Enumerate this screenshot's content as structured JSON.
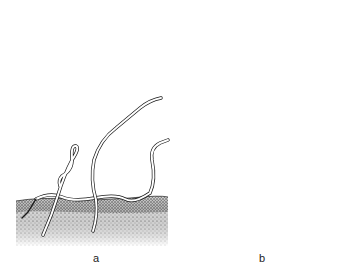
{
  "figure": {
    "colors": {
      "ink": "#1a1a1a",
      "stem_fill": "#ffffff",
      "soil_dark": "#555555",
      "background": "#ffffff"
    },
    "panels": [
      {
        "label": "a",
        "subject": "seedlings emerging from soil",
        "elements": [
          "soil-strip",
          "seedling-loop",
          "seedling-tall",
          "seedling-curved",
          "seedling-creeping"
        ]
      },
      {
        "label": "b",
        "subject": "vine twining around host stem with flower clusters and leaves",
        "elements": [
          "host-stem",
          "twining-vine",
          "branch-upper-left",
          "branch-upper-right",
          "branch-left",
          "flower-cluster-1",
          "flower-cluster-2",
          "flower-cluster-3",
          "host-leaves"
        ]
      }
    ]
  }
}
